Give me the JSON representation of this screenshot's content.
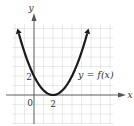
{
  "chart_data": {
    "type": "line",
    "title": "",
    "xlabel": "x",
    "ylabel": "y",
    "curve_label": "y = f(x)",
    "function": "f(x) = (x - 2)^2 / 2",
    "series": [
      {
        "name": "y = f(x)",
        "x": [
          -1.8,
          -1,
          0,
          1,
          2,
          3,
          4,
          5,
          5.8
        ],
        "y": [
          7.2,
          4.5,
          2,
          0.5,
          0,
          0.5,
          2,
          4.5,
          7.2
        ]
      }
    ],
    "tick_labels": {
      "x": [
        "0",
        "2"
      ],
      "y": [
        "2"
      ]
    },
    "xlim": [
      -2.3,
      8.2
    ],
    "ylim": [
      -3,
      7.5
    ],
    "grid": true,
    "legend": "none",
    "colors": {
      "curve": "#1a1a1a",
      "grid": "#d8d8d8",
      "axis": "#555555"
    }
  },
  "labels": {
    "x_axis": "x",
    "y_axis": "y",
    "origin": "0",
    "x_tick_2": "2",
    "y_tick_2": "2",
    "curve": "y = f(x)"
  }
}
